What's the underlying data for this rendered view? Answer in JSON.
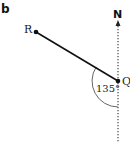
{
  "figure": {
    "panel_label": "b",
    "north_label": "N",
    "points": [
      {
        "name": "R",
        "label": "R"
      },
      {
        "name": "Q",
        "label": "Q"
      }
    ],
    "angle_label": "135°",
    "colors": {
      "line": "#111111",
      "arc": "#555555",
      "north_line": "#444444"
    }
  }
}
